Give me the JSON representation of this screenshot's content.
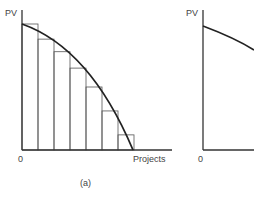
{
  "chart_data": [
    {
      "panel": "(a)",
      "type": "bar",
      "title": "",
      "ylabel": "PV",
      "xlabel": "Projects",
      "origin_label": "0",
      "categories": [
        "1",
        "2",
        "3",
        "4",
        "5",
        "6",
        "7"
      ],
      "values": [
        1.0,
        0.88,
        0.78,
        0.65,
        0.5,
        0.31,
        0.12
      ],
      "curve": {
        "type": "line",
        "description": "concave declining PV curve from y-axis to x-axis",
        "x": [
          0,
          1,
          2,
          3,
          4,
          5,
          6,
          7
        ],
        "y": [
          1.0,
          0.92,
          0.8,
          0.66,
          0.5,
          0.32,
          0.12,
          0.0
        ]
      },
      "grid": false
    },
    {
      "panel": "(b)",
      "type": "line",
      "title": "",
      "ylabel": "PV",
      "xlabel": "",
      "origin_label": "0",
      "curve": {
        "description": "concave declining PV curve (partially visible)",
        "x": [
          0,
          1,
          2
        ],
        "y": [
          1.0,
          0.93,
          0.82
        ]
      },
      "grid": false
    }
  ],
  "labels": {
    "left_ylabel": "PV",
    "left_xlabel": "Projects",
    "left_origin": "0",
    "left_caption": "(a)",
    "right_ylabel": "PV",
    "right_origin": "0"
  }
}
